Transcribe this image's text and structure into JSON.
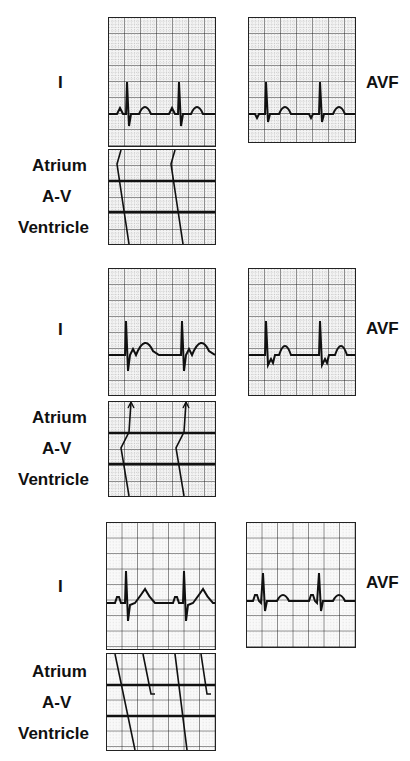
{
  "figure": {
    "colors": {
      "ink": "#111111",
      "grid_major": "#222222",
      "grid_minor": "#9a9a9a",
      "paper": "#f4f4f4"
    },
    "sections": [
      {
        "id": "section-1",
        "lead_i_label": "I",
        "avf_label": "AVF",
        "ladder_labels": {
          "atrium": "Atrium",
          "av": "A-V",
          "ventricle": "Ventricle"
        },
        "description": "Sinus rhythm, normal conduction"
      },
      {
        "id": "section-2",
        "lead_i_label": "I",
        "avf_label": "AVF",
        "ladder_labels": {
          "atrium": "Atrium",
          "av": "A-V",
          "ventricle": "Ventricle"
        },
        "description": "Junctional rhythm with retrograde atrial activation"
      },
      {
        "id": "section-3",
        "lead_i_label": "I",
        "avf_label": "AVF",
        "ladder_labels": {
          "atrium": "Atrium",
          "av": "A-V",
          "ventricle": "Ventricle"
        },
        "description": "Sinus rhythm with blocked/conducted beats"
      }
    ]
  }
}
